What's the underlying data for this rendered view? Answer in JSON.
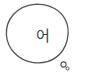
{
  "image": {
    "kind": "hand-drawn-speech-bubble",
    "width": 85,
    "height": 80,
    "background_color": "#ffffff"
  },
  "bubble": {
    "name": "speech-bubble",
    "shape": "irregular-hand-drawn-ellipse",
    "stroke_color": "#555555",
    "stroke_width": 1.3,
    "fill_color": "#ffffff",
    "center_x": 36,
    "center_y": 35,
    "radius_x": 31,
    "radius_y": 31
  },
  "text": {
    "content": "어",
    "language": "Korean",
    "color": "#3e3e3e",
    "font_size_px": 15,
    "center_x": 40,
    "center_y": 36
  },
  "tail": {
    "name": "thought-tail",
    "stroke_color": "#555555",
    "circles": [
      {
        "label": "tail-circle-large",
        "cx": 63.5,
        "cy": 64.5,
        "r": 2.6,
        "stroke_width": 1.1
      },
      {
        "label": "tail-circle-small",
        "cx": 67.5,
        "cy": 68.5,
        "r": 1.5,
        "stroke_width": 1.0
      }
    ]
  }
}
